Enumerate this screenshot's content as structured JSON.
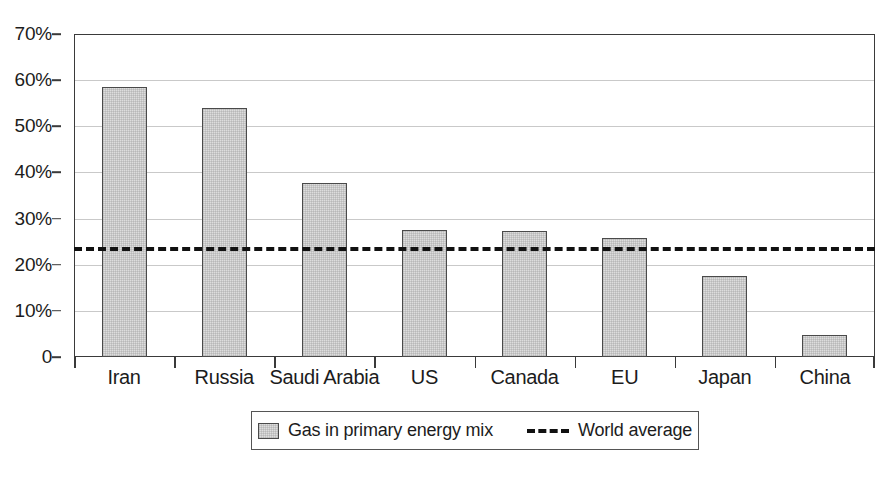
{
  "chart_data": {
    "type": "bar",
    "title": "",
    "subtitle": "",
    "xlabel": "",
    "ylabel": "",
    "ylim": [
      0,
      70
    ],
    "y_ticks": [
      0,
      10,
      20,
      30,
      40,
      50,
      60,
      70
    ],
    "y_tick_labels": [
      "0",
      "10%",
      "20%",
      "30%",
      "40%",
      "50%",
      "60%",
      "70%"
    ],
    "grid": true,
    "grid_axis": "y",
    "legend_position": "bottom-center",
    "categories": [
      "Iran",
      "Russia",
      "Saudi Arabia",
      "US",
      "Canada",
      "EU",
      "Japan",
      "China"
    ],
    "series": [
      {
        "name": "Gas in primary energy mix",
        "type": "bar",
        "values": [
          58.5,
          54.0,
          37.8,
          27.5,
          27.3,
          25.8,
          17.5,
          4.7
        ],
        "fill_color": "#dddddd",
        "edge_color": "#4a4a4a"
      },
      {
        "name": "World average",
        "type": "hline",
        "value": 23.8,
        "line_style": "dashed",
        "line_color": "#111111"
      }
    ],
    "annotations": []
  },
  "legend": {
    "entries": [
      {
        "label": "Gas in primary energy mix",
        "marker": "bar-swatch-icon"
      },
      {
        "label": "World average",
        "marker": "dashed-line-icon"
      }
    ]
  },
  "colors": {
    "bar_fill": "#dddddd",
    "bar_edge": "#4a4a4a",
    "axis": "#3a3a3a",
    "gridline": "#c9c9c9",
    "average_line": "#111111",
    "text": "#1c1c1c",
    "background": "#ffffff"
  }
}
